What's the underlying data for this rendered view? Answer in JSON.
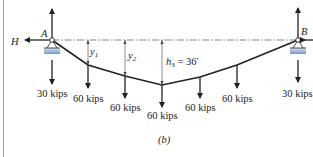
{
  "figure": {
    "caption": "(b)",
    "support_left": {
      "label": "A",
      "reaction": "H",
      "load": "30 kips"
    },
    "support_right": {
      "label": "B",
      "reaction": "H",
      "load": "30 kips"
    },
    "sag_labels": {
      "y1": "y",
      "y1_sub": "1",
      "y2": "y",
      "y2_sub": "2",
      "h3": "h",
      "h3_sub": "3",
      "h3_value": " = 36′"
    },
    "loads": [
      "60 kips",
      "60 kips",
      "60 kips",
      "60 kips",
      "60 kips"
    ],
    "colors": {
      "line": "#222222",
      "border": "#8fa3c8",
      "support": "#7fa6d6",
      "chord": "#555555"
    }
  }
}
